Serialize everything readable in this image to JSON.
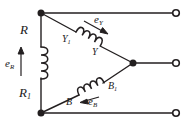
{
  "figure": {
    "type": "three-phase-winding-schematic",
    "stroke_color": "#231f20",
    "background_color": "#ffffff"
  },
  "labels": {
    "phase_r": {
      "base": "R",
      "sub": ""
    },
    "phase_r1": {
      "base": "R",
      "sub": "1"
    },
    "emf_r": {
      "base": "e",
      "sub": "R"
    },
    "phase_y1": {
      "base": "Y",
      "sub": "1"
    },
    "phase_y": {
      "base": "Y",
      "sub": ""
    },
    "emf_y": {
      "base": "e",
      "sub": "Y"
    },
    "phase_b1": {
      "base": "B",
      "sub": "1"
    },
    "phase_b": {
      "base": "B",
      "sub": ""
    },
    "emf_b": {
      "base": "e",
      "sub": "B"
    }
  },
  "nodes": {
    "top_left": {
      "x": 41,
      "y": 13,
      "style": "filled-dot"
    },
    "bottom_left": {
      "x": 41,
      "y": 113,
      "style": "filled-dot"
    },
    "center_right": {
      "x": 133,
      "y": 63,
      "style": "filled-dot"
    },
    "terminal_top": {
      "x": 176,
      "y": 13,
      "style": "open-circle"
    },
    "terminal_middle": {
      "x": 176,
      "y": 63,
      "style": "open-circle"
    },
    "terminal_bottom": {
      "x": 176,
      "y": 113,
      "style": "open-circle"
    }
  },
  "coils": {
    "r_coil": {
      "turns": 4,
      "orientation": "vertical",
      "bumps": "right"
    },
    "y_coil": {
      "turns": 4,
      "orientation": "diagonal-down-right"
    },
    "b_coil": {
      "turns": 4,
      "orientation": "diagonal-up-right"
    }
  },
  "arrows": {
    "emf_r_direction": "up",
    "emf_y_direction": "down-right",
    "emf_b_direction": "left-down"
  }
}
